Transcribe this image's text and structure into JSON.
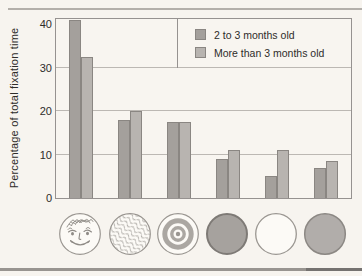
{
  "figure": {
    "ylabel": "Percentage of total fixation time"
  },
  "chart_data": {
    "type": "bar",
    "title": "",
    "xlabel": "",
    "ylabel": "Percentage of total fixation time",
    "categories": [
      "schematic-face-disc",
      "wavy-texture-disc",
      "bullseye-disc",
      "dark-plain-disc",
      "white-plain-disc",
      "gray-plain-disc"
    ],
    "series": [
      {
        "name": "2 to 3 months old",
        "color": "#a4a09c",
        "values": [
          41,
          18,
          17.5,
          9,
          5,
          7
        ]
      },
      {
        "name": "More than 3 months old",
        "color": "#b8b4b0",
        "values": [
          32.5,
          20,
          17.5,
          11,
          11,
          8.5
        ]
      }
    ],
    "yticks": [
      0,
      10,
      20,
      30,
      40
    ],
    "ylim": [
      0,
      41.2
    ],
    "grid": {
      "horizontal": [
        10,
        20,
        30
      ]
    },
    "legend_position": "top-right-inside",
    "bar_border_color": "#8a8682",
    "frame_color": "#969290",
    "gridline_color": "#bcb8b3"
  }
}
